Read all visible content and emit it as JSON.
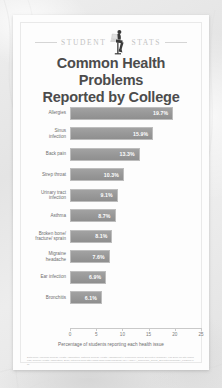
{
  "header": {
    "kicker_left": "STUDENT",
    "kicker_right": "STATS",
    "icon": "student-with-laptop-silhouette"
  },
  "title": {
    "line1": "Common Health Problems",
    "line2": "Reported by College Students"
  },
  "colors": {
    "bar": "#989898",
    "bar_border": "#bdbdbd",
    "title_text": "#4c4c4c",
    "label_text": "#6d6d6d",
    "kicker_text": "#c3c3c3",
    "value_text": "#ffffff",
    "card_background": "#fdfdfd",
    "page_background": "#e8e8e8"
  },
  "chart_data": {
    "type": "bar",
    "orientation": "horizontal",
    "title": "Common Health Problems Reported by College Students",
    "subtitle": "",
    "xlabel": "Percentage of students reporting each health issue",
    "ylabel": "",
    "xlim": [
      0,
      25
    ],
    "xticks": [
      0,
      5,
      10,
      15,
      20,
      25
    ],
    "xtick_labels": [
      "0",
      "5",
      "10",
      "15",
      "20",
      "25"
    ],
    "grid": false,
    "legend": false,
    "categories": [
      "Allergies",
      "Sinus infection",
      "Back pain",
      "Strep throat",
      "Urinary tract infection",
      "Asthma",
      "Broken bone/ fracture/ sprain",
      "Migraine headache",
      "Ear infection",
      "Bronchitis"
    ],
    "values": [
      19.7,
      15.9,
      13.3,
      10.3,
      9.1,
      8.7,
      8.1,
      7.6,
      6.9,
      6.1
    ],
    "value_labels": [
      "19.7%",
      "15.9%",
      "13.3%",
      "10.3%",
      "9.1%",
      "8.7%",
      "8.1%",
      "7.6%",
      "6.9%",
      "6.1%"
    ],
    "bars": [
      {
        "label_line1": "Allergies",
        "label_line2": "",
        "value": 19.7,
        "value_label": "19.7%"
      },
      {
        "label_line1": "Sinus",
        "label_line2": "infection",
        "value": 15.9,
        "value_label": "15.9%"
      },
      {
        "label_line1": "Back pain",
        "label_line2": "",
        "value": 13.3,
        "value_label": "13.3%"
      },
      {
        "label_line1": "Strep throat",
        "label_line2": "",
        "value": 10.3,
        "value_label": "10.3%"
      },
      {
        "label_line1": "Urinary tract",
        "label_line2": "infection",
        "value": 9.1,
        "value_label": "9.1%"
      },
      {
        "label_line1": "Asthma",
        "label_line2": "",
        "value": 8.7,
        "value_label": "8.7%"
      },
      {
        "label_line1": "Broken bone/",
        "label_line2": "fracture/ sprain",
        "value": 8.1,
        "value_label": "8.1%"
      },
      {
        "label_line1": "Migraine",
        "label_line2": "headache",
        "value": 7.6,
        "value_label": "7.6%"
      },
      {
        "label_line1": "Ear infection",
        "label_line2": "",
        "value": 6.9,
        "value_label": "6.9%"
      },
      {
        "label_line1": "Bronchitis",
        "label_line2": "",
        "value": 6.1,
        "value_label": "6.1%"
      }
    ]
  },
  "source": {
    "text": "Data from American College Health Association, National College Health Assessment II: Reference Group Executive Summary, Fall 2009 for site download; College Health Association, 2010; retrieved from http://www.acha-ncha.org/docs/ACHA-NCHA_Reference_Group_ExecutiveSummary_Fall2009.pdf"
  }
}
